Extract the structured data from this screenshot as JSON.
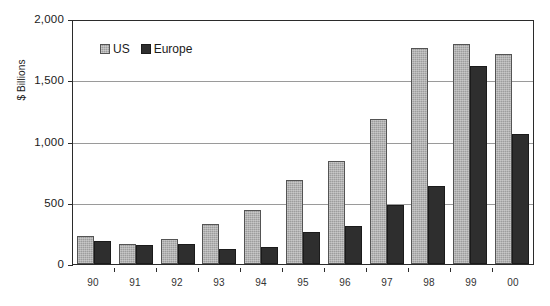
{
  "chart_data": {
    "type": "bar",
    "title": "",
    "xlabel": "",
    "ylabel": "$ Billions",
    "ylim": [
      0,
      2000
    ],
    "yticks": [
      0,
      500,
      1000,
      1500,
      2000
    ],
    "ytick_labels": [
      "0",
      "500",
      "1,000",
      "1,500",
      "2,000"
    ],
    "grid": true,
    "legend_position": "top-left-inside",
    "categories": [
      "90",
      "91",
      "92",
      "93",
      "94",
      "95",
      "96",
      "97",
      "98",
      "99",
      "00"
    ],
    "series": [
      {
        "name": "US",
        "color": "#9d9d9d",
        "values": [
          230,
          165,
          205,
          330,
          440,
          685,
          840,
          1180,
          1760,
          1795,
          1715
        ]
      },
      {
        "name": "Europe",
        "color": "#2e2e2e",
        "values": [
          185,
          155,
          160,
          125,
          140,
          260,
          310,
          480,
          640,
          1615,
          1065
        ]
      }
    ]
  }
}
